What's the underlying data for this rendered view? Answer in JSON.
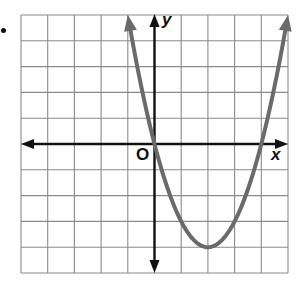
{
  "labels": {
    "x_axis": "x",
    "y_axis": "y",
    "origin": "O"
  },
  "colors": {
    "grid": "#8a8a8a",
    "axes": "#111111",
    "curve": "#6a6a6a",
    "background": "#ffffff"
  },
  "chart_data": {
    "type": "line",
    "title": "",
    "xlabel": "x",
    "ylabel": "y",
    "xlim": [
      -5,
      5
    ],
    "ylim": [
      -5,
      5
    ],
    "grid": true,
    "grid_step": 1,
    "axis_arrows": true,
    "origin_label": "O",
    "series": [
      {
        "name": "parabola",
        "equation": "y = x^2 - 4x",
        "vertex": [
          2,
          -4
        ],
        "x_intercepts": [
          0,
          4
        ],
        "x": [
          -1,
          0,
          1,
          2,
          3,
          4,
          5
        ],
        "y": [
          5,
          0,
          -3,
          -4,
          -3,
          0,
          5
        ],
        "end_arrows": true
      }
    ]
  }
}
